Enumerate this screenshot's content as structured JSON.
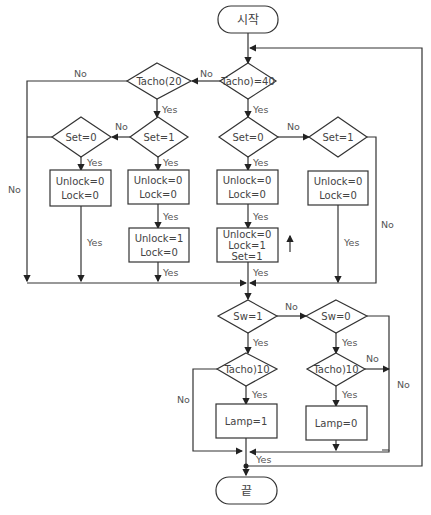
{
  "flowchart": {
    "start": "시작",
    "end": "끝",
    "decisions": {
      "tacho_ge_40": "Tacho)=40",
      "tacho_lt_20": "Tacho(20",
      "set_eq_1_left": "Set=1",
      "set_eq_0_left": "Set=0",
      "set_eq_0_right": "Set=0",
      "set_eq_1_right": "Set=1",
      "sw_eq_1": "Sw=1",
      "sw_eq_0": "Sw=0",
      "tacho_gt_10_left": "Tacho)10",
      "tacho_gt_10_right": "Tacho)10"
    },
    "processes": {
      "p1": [
        "Unlock=0",
        "Lock=0"
      ],
      "p2": [
        "Unlock=0",
        "Lock=0"
      ],
      "p3": [
        "Unlock=1",
        "Lock=0"
      ],
      "p4": [
        "Unlock=0",
        "Lock=0"
      ],
      "p5": [
        "Unlock=0",
        "Lock=1",
        "Set=1"
      ],
      "p6": [
        "Unlock=0",
        "Lock=0"
      ],
      "lamp_on": "Lamp=1",
      "lamp_off": "Lamp=0"
    },
    "labels": {
      "yes": "Yes",
      "no": "No"
    }
  }
}
